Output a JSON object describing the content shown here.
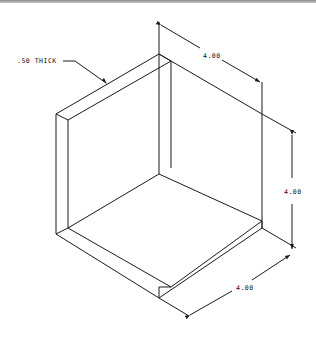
{
  "drawing": {
    "type": "isometric technical drawing",
    "subject": "open box corner (two walls and floor)",
    "annotations": {
      "thickness_label": ".50 THICK",
      "dim_top": "4.00",
      "dim_right": "4.00",
      "dim_bottom": "4.00"
    },
    "colors": {
      "line": "#1a1a1a",
      "background": "#ffffff",
      "top_bar": "#8a8a8a"
    }
  }
}
